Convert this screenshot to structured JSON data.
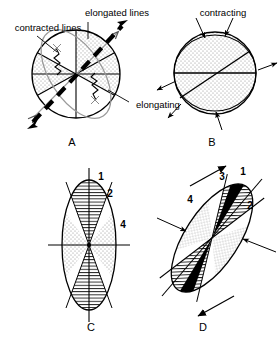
{
  "figure": {
    "title_visible": false,
    "background_color": "#ffffff",
    "line_color": "#000000",
    "dot_fill_color": "#7d7d7d",
    "black_fill_color": "#000000",
    "panels": [
      {
        "id": "A",
        "label": "A",
        "label_x": 72,
        "label_y": 146,
        "description": "circle with superimposed tilted strain ellipse, dotted sectors, bold dashed extension direction with double arrows, zigzag lines in contracted sectors",
        "annotations": [
          {
            "name": "elongated-lines",
            "text": "elongated lines",
            "x": 117,
            "y": 16,
            "anchor": "middle"
          },
          {
            "name": "contracted-lines",
            "text": "contracted lines",
            "x": 48,
            "y": 31,
            "anchor": "middle"
          },
          {
            "name": "elongating",
            "text": "elongating",
            "x": 158,
            "y": 108,
            "anchor": "middle"
          }
        ]
      },
      {
        "id": "B",
        "label": "B",
        "label_x": 212,
        "label_y": 146,
        "description": "dotted circle with horizontal diameter and tilted chord, inward arrows top and bottom, outward arrows left and right",
        "annotations": [
          {
            "name": "contracting",
            "text": "contracting",
            "x": 223,
            "y": 16,
            "anchor": "middle"
          }
        ]
      },
      {
        "id": "C",
        "label": "C",
        "label_x": 91,
        "label_y": 331,
        "description": "upright strain ellipse with four alternating sectors, horizontal dotted sectors and vertical hatched sectors, numbered 1 2 4",
        "sector_numbers": [
          {
            "name": "sector-number-1",
            "text": "1",
            "x": 101,
            "y": 180
          },
          {
            "name": "sector-number-2",
            "text": "2",
            "x": 110,
            "y": 197
          },
          {
            "name": "sector-number-4",
            "text": "4",
            "x": 123,
            "y": 228
          }
        ]
      },
      {
        "id": "D",
        "label": "D",
        "label_x": 203,
        "label_y": 331,
        "description": "tilted strain ellipse with four sectors: dotted, hatched and black filled, numbered 1 2 3 4, with shear arrows and inward compression arrows",
        "sector_numbers": [
          {
            "name": "sector-number-1",
            "text": "1",
            "x": 243,
            "y": 175
          },
          {
            "name": "sector-number-2",
            "text": "2",
            "x": 250,
            "y": 209
          },
          {
            "name": "sector-number-3",
            "text": "3",
            "x": 222,
            "y": 180
          },
          {
            "name": "sector-number-4",
            "text": "4",
            "x": 190,
            "y": 203
          }
        ]
      }
    ]
  }
}
